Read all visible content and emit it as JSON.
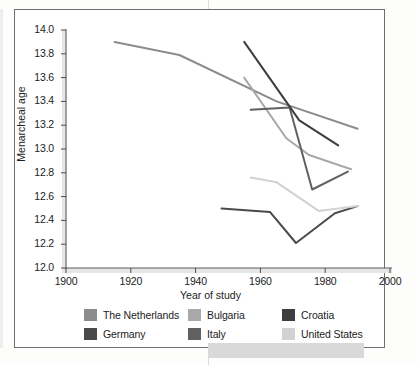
{
  "chart_data": {
    "type": "line",
    "title": "",
    "xlabel": "Year of study",
    "ylabel": "Menarcheal age",
    "xlim": [
      1900,
      2000
    ],
    "ylim": [
      12.0,
      14.0
    ],
    "xticks": [
      1900,
      1920,
      1940,
      1960,
      1980,
      2000
    ],
    "yticks": [
      12.0,
      12.2,
      12.4,
      12.6,
      12.8,
      13.0,
      13.2,
      13.4,
      13.6,
      13.8,
      14.0
    ],
    "grid": false,
    "legend_position": "bottom",
    "series": [
      {
        "name": "The Netherlands",
        "color": "#8c8c8c",
        "x": [
          1915,
          1935,
          1965,
          1990
        ],
        "values": [
          13.9,
          13.79,
          13.4,
          13.17
        ]
      },
      {
        "name": "Germany",
        "color": "#4a4a4a",
        "x": [
          1948,
          1963,
          1971,
          1983,
          1990
        ],
        "values": [
          12.5,
          12.47,
          12.21,
          12.46,
          12.52
        ]
      },
      {
        "name": "Bulgaria",
        "color": "#a8a8a8",
        "x": [
          1955,
          1968,
          1975,
          1988
        ],
        "values": [
          13.6,
          13.09,
          12.95,
          12.83
        ]
      },
      {
        "name": "Italy",
        "color": "#616161",
        "x": [
          1957,
          1969,
          1976,
          1987
        ],
        "values": [
          13.33,
          13.35,
          12.66,
          12.81
        ]
      },
      {
        "name": "Croatia",
        "color": "#3d3d3d",
        "x": [
          1955,
          1972,
          1984
        ],
        "values": [
          13.9,
          13.24,
          13.03
        ]
      },
      {
        "name": "United States",
        "color": "#d2d2d2",
        "x": [
          1957,
          1965,
          1978,
          1990
        ],
        "values": [
          12.76,
          12.72,
          12.48,
          12.52
        ]
      }
    ]
  },
  "legend": {
    "entries": [
      {
        "label": "The Netherlands",
        "color": "#8c8c8c"
      },
      {
        "label": "Bulgaria",
        "color": "#a8a8a8"
      },
      {
        "label": "Croatia",
        "color": "#3d3d3d"
      },
      {
        "label": "Germany",
        "color": "#4a4a4a"
      },
      {
        "label": "Italy",
        "color": "#616161"
      },
      {
        "label": "United States",
        "color": "#d2d2d2"
      }
    ]
  },
  "axis_text": {
    "y_tick_labels": [
      "14.0",
      "13.8",
      "13.6",
      "13.4",
      "13.2",
      "13.0",
      "12.8",
      "12.6",
      "12.4",
      "12.2",
      "12.0"
    ],
    "x_tick_labels": [
      "1900",
      "1920",
      "1940",
      "1960",
      "1980",
      "2000"
    ],
    "y_axis_title": "Menarcheal age",
    "x_axis_title": "Year of study"
  }
}
